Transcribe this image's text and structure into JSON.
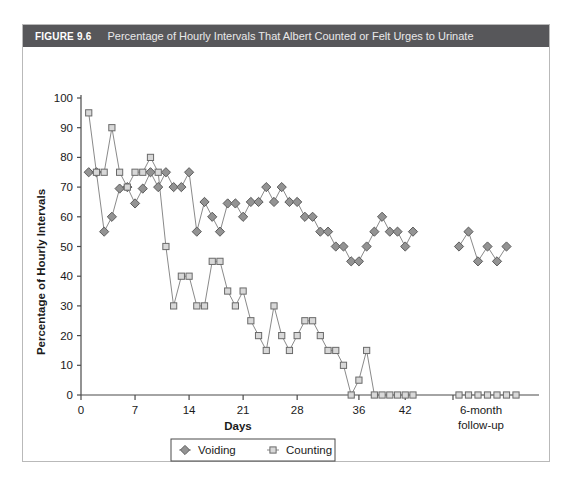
{
  "figure": {
    "number": "FIGURE 9.6",
    "caption": "Percentage of Hourly Intervals That Albert Counted or Felt Urges to Urinate"
  },
  "chart_data": {
    "type": "line",
    "title": "Percentage of Hourly Intervals That Albert Counted or Felt Urges to Urinate",
    "xlabel": "Days",
    "ylabel": "Percentage of Hourly Intervals",
    "ylim": [
      0,
      100
    ],
    "ytick_labels": [
      "0",
      "10",
      "20",
      "30",
      "40",
      "50",
      "60",
      "70",
      "80",
      "90",
      "100"
    ],
    "ytick_values": [
      0,
      10,
      20,
      30,
      40,
      50,
      60,
      70,
      80,
      90,
      100
    ],
    "xtick_labels": [
      "0",
      "7",
      "14",
      "21",
      "28",
      "36",
      "42"
    ],
    "xtick_values": [
      0,
      7,
      14,
      21,
      28,
      36,
      42
    ],
    "followup_label_line1": "6-month",
    "followup_label_line2": "follow-up",
    "grid": false,
    "legend_position": "bottom-center",
    "series": [
      {
        "name": "Voiding",
        "marker": "filled-diamond",
        "color": "#939393",
        "x": [
          1,
          2,
          3,
          4,
          5,
          6,
          7,
          8,
          9,
          10,
          11,
          12,
          13,
          14,
          15,
          16,
          17,
          18,
          19,
          20,
          21,
          22,
          23,
          24,
          25,
          26,
          27,
          28,
          29,
          30,
          31,
          32,
          33,
          34,
          35,
          36,
          37,
          38,
          39,
          40,
          41,
          42,
          43
        ],
        "values": [
          75,
          75,
          55,
          60,
          69.5,
          70,
          64.5,
          69.5,
          75,
          70,
          75,
          70,
          70,
          75,
          55,
          65,
          60,
          55,
          64.5,
          64.5,
          60,
          65,
          65,
          70,
          65,
          70,
          65,
          65,
          60,
          60,
          55,
          55,
          50,
          50,
          45,
          45,
          50,
          55,
          60,
          55,
          55,
          50,
          55
        ]
      },
      {
        "name": "Counting",
        "marker": "open-square",
        "color": "#d8d8d8",
        "x": [
          1,
          2,
          3,
          4,
          5,
          6,
          7,
          8,
          9,
          10,
          11,
          12,
          13,
          14,
          15,
          16,
          17,
          18,
          19,
          20,
          21,
          22,
          23,
          24,
          25,
          26,
          27,
          28,
          29,
          30,
          31,
          32,
          33,
          34,
          35,
          36,
          37,
          38,
          39,
          40,
          41,
          42,
          43
        ],
        "values": [
          95,
          75,
          75,
          90,
          75,
          70,
          75,
          75,
          80,
          75,
          50,
          30,
          40,
          40,
          30,
          30,
          45,
          45,
          35,
          30,
          35,
          25,
          20,
          15,
          30,
          20,
          15,
          20,
          25,
          25,
          20,
          15,
          15,
          10,
          0,
          5,
          15,
          0,
          0,
          0,
          0,
          0,
          0
        ]
      }
    ],
    "followup": {
      "voiding": {
        "positions": [
          0,
          1,
          2,
          3,
          4,
          5
        ],
        "values": [
          50,
          55,
          45,
          50,
          45,
          50
        ]
      },
      "counting": {
        "positions": [
          0,
          1,
          2,
          3,
          4,
          5,
          6
        ],
        "values": [
          0,
          0,
          0,
          0,
          0,
          0,
          0
        ]
      }
    },
    "legend": [
      {
        "label": "Voiding",
        "marker": "filled-diamond"
      },
      {
        "label": "Counting",
        "marker": "open-square"
      }
    ]
  }
}
